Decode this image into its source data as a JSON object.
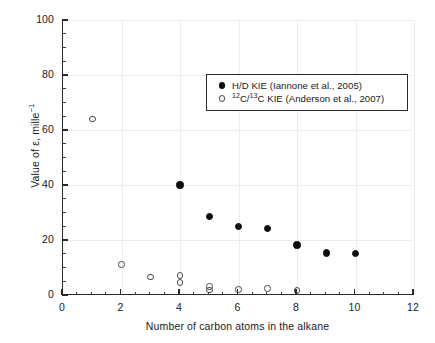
{
  "chart_data": {
    "type": "scatter",
    "title": "",
    "xlabel": "Number of carbon atoms in the alkane",
    "ylabel_parts": {
      "pre": "Value of ε, mille",
      "sup": "−1"
    },
    "ylabel_plain": "Value of ε, mille⁻¹",
    "xlim": [
      0,
      12
    ],
    "ylim": [
      0,
      100
    ],
    "xticks": [
      0,
      2,
      4,
      6,
      8,
      10,
      12
    ],
    "yticks": [
      0,
      20,
      40,
      60,
      80,
      100
    ],
    "x_minor_step": 0.5,
    "y_minor_step": 5,
    "grid": "major-light-gray",
    "grid_color": "#ededed",
    "legend_position": "upper-right-inside",
    "series": [
      {
        "name": "H/D KIE (Iannone et al., 2005)",
        "marker": "filled-circle",
        "color": "#0d0d0d",
        "points": [
          {
            "x": 4,
            "y": 40.0
          },
          {
            "x": 5,
            "y": 28.5
          },
          {
            "x": 6,
            "y": 25.0
          },
          {
            "x": 7,
            "y": 24.2
          },
          {
            "x": 8,
            "y": 18.2
          },
          {
            "x": 9,
            "y": 15.3
          },
          {
            "x": 10,
            "y": 15.2
          }
        ]
      },
      {
        "name": "12C/13C KIE (Anderson et al., 2007)",
        "marker": "open-circle",
        "color": "#4a4a4a",
        "points": [
          {
            "x": 1,
            "y": 64.0
          },
          {
            "x": 2,
            "y": 11.0
          },
          {
            "x": 3,
            "y": 6.5
          },
          {
            "x": 4,
            "y": 7.0
          },
          {
            "x": 4,
            "y": 4.6
          },
          {
            "x": 5,
            "y": 3.1
          },
          {
            "x": 5,
            "y": 1.8
          },
          {
            "x": 6,
            "y": 2.0
          },
          {
            "x": 7,
            "y": 2.3
          },
          {
            "x": 8,
            "y": 1.7
          }
        ]
      }
    ]
  },
  "legend": {
    "entries": [
      {
        "marker": "filled-circle",
        "label": "H/D KIE (Iannone et al., 2005)",
        "sup_prefix": ""
      },
      {
        "marker": "open-circle",
        "label": "C/",
        "sup_prefix": "12",
        "sup_mid": "13",
        "label_tail": "C KIE (Anderson et al., 2007)"
      }
    ]
  },
  "axes": {
    "x_tick_labels": [
      "0",
      "2",
      "4",
      "6",
      "8",
      "10",
      "12"
    ],
    "y_tick_labels": [
      "0",
      "20",
      "40",
      "60",
      "80",
      "100"
    ],
    "x_title": "Number of carbon atoms in the alkane",
    "y_title_pre": "Value of ε, mille",
    "y_title_sup": "−1"
  }
}
